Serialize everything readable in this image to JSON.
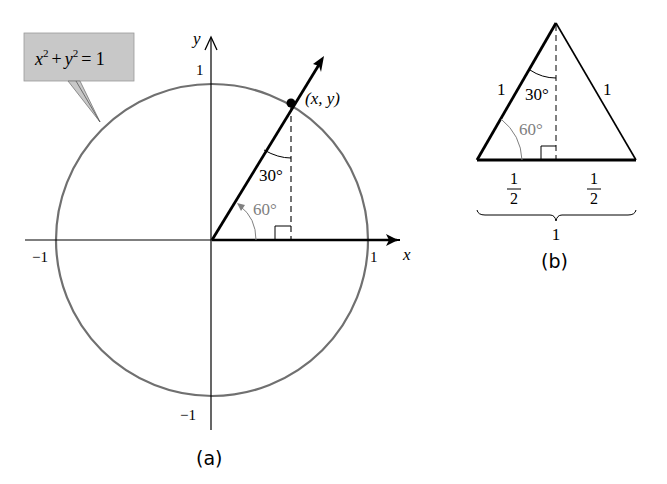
{
  "figure_a": {
    "caption": "(a)",
    "equation_label": "x² + y² = 1",
    "eq_x": "x",
    "eq_y": "y",
    "eq_plus": "+",
    "eq_equals": "= 1",
    "eq_exp": "2",
    "axis_x_label": "x",
    "axis_y_label": "y",
    "tick_x_pos": "1",
    "tick_x_neg": "−1",
    "tick_y_pos": "1",
    "tick_y_neg": "−1",
    "point_label": "(x, y)",
    "angle_inner": "30°",
    "angle_base": "60°",
    "colors": {
      "circle": "#707070",
      "callout_fill": "#c8c8c8",
      "angle_gray": "#808080",
      "line": "#000000"
    }
  },
  "figure_b": {
    "caption": "(b)",
    "side_left": "1",
    "side_right": "1",
    "angle_top": "30°",
    "angle_base": "60°",
    "half_left_num": "1",
    "half_left_den": "2",
    "half_right_num": "1",
    "half_right_den": "2",
    "base_total": "1"
  }
}
